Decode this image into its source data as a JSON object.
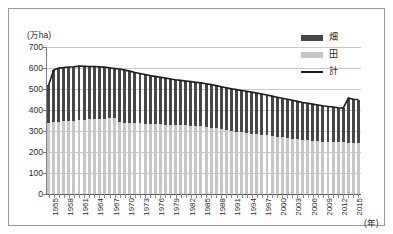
{
  "figure": {
    "unit_label": "(万ha)",
    "x_axis_unit": "(年)"
  },
  "legend": {
    "position": "top-right",
    "items": [
      {
        "label": "畑",
        "type": "bar",
        "color": "#474747"
      },
      {
        "label": "田",
        "type": "bar",
        "color": "#c7c7c7"
      },
      {
        "label": "計",
        "type": "line",
        "color": "#1c1c1c"
      }
    ]
  },
  "chart_data": {
    "type": "bar",
    "title": "",
    "subtitle": "",
    "xlabel": "(年)",
    "ylabel": "(万ha)",
    "ylim": [
      0,
      700
    ],
    "ytick_step": 100,
    "yticks": [
      700,
      600,
      500,
      400,
      300,
      200,
      100,
      0
    ],
    "grid": true,
    "stacked": true,
    "legend_position": "top-right",
    "x": [
      1955,
      1956,
      1957,
      1958,
      1959,
      1960,
      1961,
      1962,
      1963,
      1964,
      1965,
      1966,
      1967,
      1968,
      1969,
      1970,
      1971,
      1972,
      1973,
      1974,
      1975,
      1976,
      1977,
      1978,
      1979,
      1980,
      1981,
      1982,
      1983,
      1984,
      1985,
      1986,
      1987,
      1988,
      1989,
      1990,
      1991,
      1992,
      1993,
      1994,
      1995,
      1996,
      1997,
      1998,
      1999,
      2000,
      2001,
      2002,
      2003,
      2004,
      2005,
      2006,
      2007,
      2008,
      2009,
      2010,
      2011,
      2012,
      2013,
      2014,
      2015,
      2016
    ],
    "xtick_labels": [
      "1955",
      "1958",
      "1961",
      "1964",
      "1967",
      "1970",
      "1973",
      "1976",
      "1979",
      "1982",
      "1985",
      "1988",
      "1991",
      "1994",
      "1997",
      "2000",
      "2003",
      "2006",
      "2009",
      "2012",
      "2015"
    ],
    "xtick_every": 3,
    "series": [
      {
        "name": "田",
        "color": "#c7c7c7",
        "values": [
          340,
          343,
          345,
          347,
          348,
          350,
          352,
          354,
          356,
          357,
          358,
          359,
          360,
          361,
          341,
          340,
          339,
          337,
          336,
          335,
          334,
          333,
          332,
          331,
          330,
          329,
          328,
          327,
          326,
          325,
          324,
          320,
          316,
          312,
          308,
          304,
          300,
          297,
          294,
          291,
          288,
          285,
          282,
          279,
          276,
          273,
          270,
          267,
          264,
          261,
          258,
          256,
          254,
          252,
          250,
          249,
          248,
          247,
          246,
          245,
          244,
          244
        ]
      },
      {
        "name": "畑",
        "color": "#474747",
        "values": [
          178,
          247,
          255,
          255,
          257,
          256,
          257,
          254,
          251,
          250,
          248,
          245,
          241,
          237,
          254,
          250,
          246,
          242,
          238,
          234,
          230,
          227,
          224,
          221,
          218,
          215,
          213,
          211,
          209,
          207,
          205,
          205,
          205,
          204,
          203,
          202,
          201,
          200,
          199,
          198,
          197,
          196,
          194,
          192,
          190,
          188,
          186,
          184,
          182,
          180,
          178,
          176,
          174,
          172,
          170,
          168,
          166,
          164,
          163,
          212,
          207,
          206
        ]
      }
    ],
    "total_line": {
      "name": "計",
      "color": "#1c1c1c",
      "values": [
        518,
        590,
        600,
        602,
        605,
        606,
        609,
        608,
        607,
        607,
        606,
        604,
        601,
        598,
        595,
        590,
        585,
        579,
        574,
        569,
        564,
        560,
        556,
        552,
        548,
        544,
        541,
        538,
        535,
        532,
        529,
        525,
        521,
        516,
        511,
        506,
        501,
        497,
        493,
        489,
        485,
        481,
        476,
        471,
        466,
        461,
        456,
        451,
        446,
        441,
        436,
        432,
        428,
        424,
        420,
        417,
        414,
        411,
        409,
        457,
        451,
        450
      ]
    }
  }
}
